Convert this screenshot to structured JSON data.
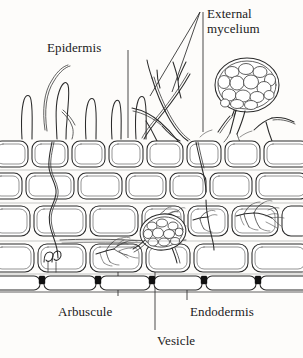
{
  "figure": {
    "background_color": "#fdfcfa",
    "ink_color": "#1a1a1a",
    "width": 303,
    "height": 358
  },
  "labels": {
    "epidermis": "Epidermis",
    "external_mycelium": "External mycelium",
    "arbuscule": "Arbuscule",
    "vesicle": "Vesicle",
    "endodermis": "Endodermis"
  },
  "structures": {
    "root_hairs": "root-hairs",
    "spore": "spore",
    "hyphae": "external-hyphae",
    "cortex_cells": "cortex-cell-rows",
    "casparian_strip": "casparian-strip-dots"
  }
}
